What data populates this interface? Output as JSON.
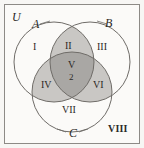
{
  "diagram": {
    "type": "venn-3-set",
    "universe_label": "U",
    "sets": [
      {
        "id": "A",
        "label": "A"
      },
      {
        "id": "B",
        "label": "B"
      },
      {
        "id": "C",
        "label": "C"
      }
    ],
    "regions": [
      {
        "id": "I",
        "label": "I",
        "meaning": "A only",
        "shaded": false
      },
      {
        "id": "II",
        "label": "II",
        "meaning": "A and B only",
        "shaded": true
      },
      {
        "id": "III",
        "label": "III",
        "meaning": "B only",
        "shaded": false
      },
      {
        "id": "IV",
        "label": "IV",
        "meaning": "A and C only",
        "shaded": true
      },
      {
        "id": "V",
        "label": "V",
        "meaning": "A and B and C",
        "shaded": true
      },
      {
        "id": "VI",
        "label": "VI",
        "meaning": "B and C only",
        "shaded": true
      },
      {
        "id": "VII",
        "label": "VII",
        "meaning": "C only",
        "shaded": false
      },
      {
        "id": "VIII",
        "label": "VIII",
        "meaning": "outside all sets",
        "shaded": false
      }
    ],
    "annotations": [
      {
        "region": "V",
        "value": "2"
      }
    ],
    "colors": {
      "background": "#fbfaf8",
      "page": "#f7f6f4",
      "outline": "#6f6c68",
      "border": "#8d8a86",
      "pair_fill": "#c9c7c4",
      "triple_fill": "#a9a7a4",
      "text": "#2b2926"
    }
  }
}
